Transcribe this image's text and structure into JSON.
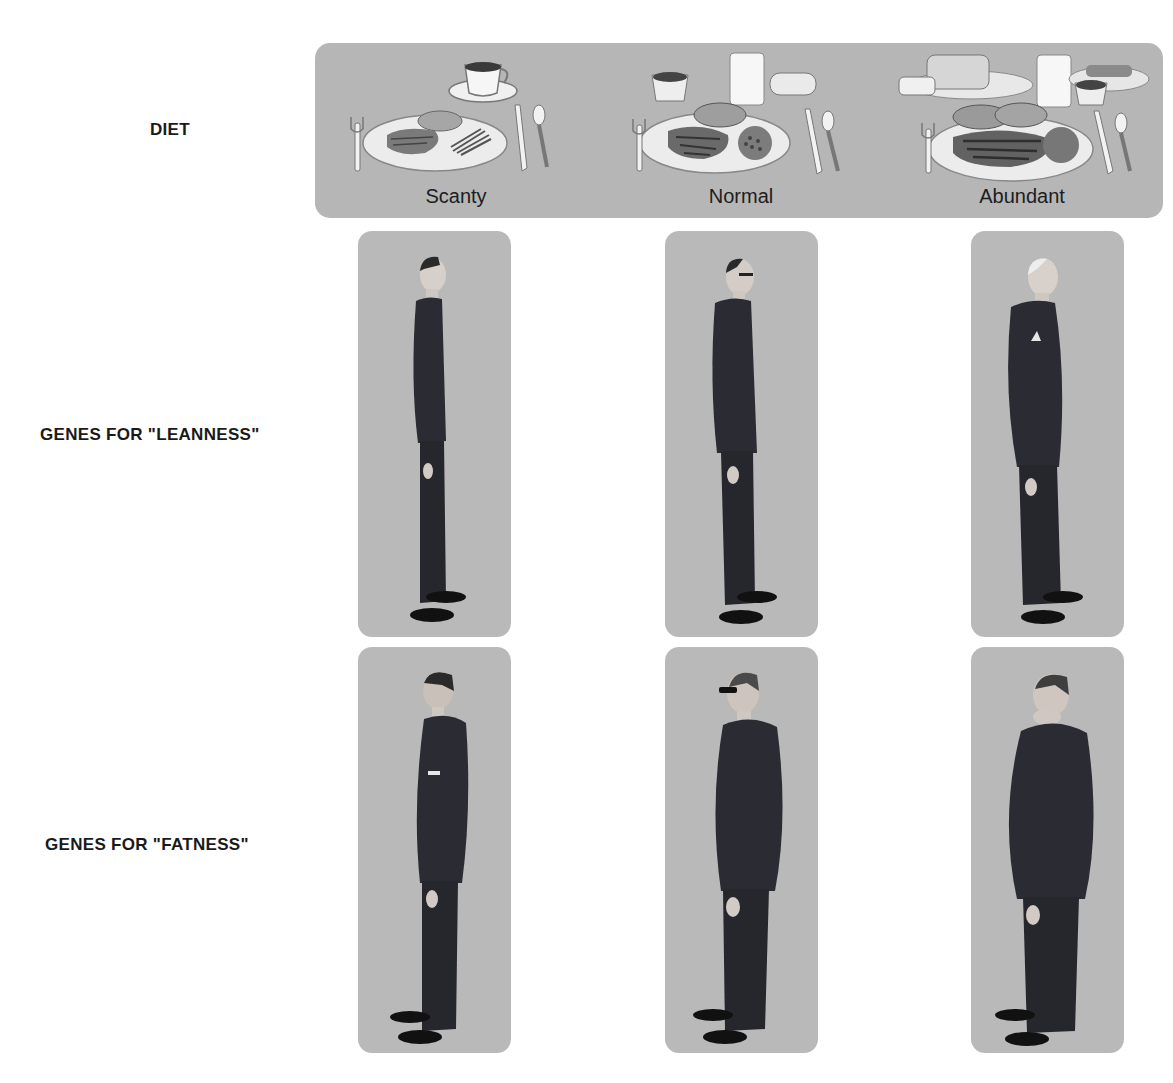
{
  "row_labels": {
    "diet": "DIET",
    "leanness": "GENES FOR \"LEANNESS\"",
    "fatness": "GENES FOR \"FATNESS\""
  },
  "diet_levels": [
    {
      "label": "Scanty",
      "items": [
        "coffee-cup",
        "plate-meat",
        "bread-roll",
        "green-beans",
        "fork",
        "knife",
        "spoon"
      ]
    },
    {
      "label": "Normal",
      "items": [
        "dessert-cup",
        "milk-glass",
        "bread-roll",
        "plate-steak",
        "potato",
        "peas",
        "fork",
        "knife",
        "spoon"
      ]
    },
    {
      "label": "Abundant",
      "items": [
        "bread-loaf",
        "butter-dish",
        "milk-glass",
        "side-dish",
        "dessert-cup",
        "plate-steak",
        "potatoes",
        "vegetables",
        "fork",
        "knife",
        "spoon"
      ]
    }
  ],
  "figures": {
    "leanness": [
      {
        "diet": "Scanty",
        "build": "very thin",
        "facing": "right",
        "hair": "dark"
      },
      {
        "diet": "Normal",
        "build": "thin",
        "facing": "right",
        "hair": "dark, glasses"
      },
      {
        "diet": "Abundant",
        "build": "slightly stout",
        "facing": "right",
        "hair": "white"
      }
    ],
    "fatness": [
      {
        "diet": "Scanty",
        "build": "average",
        "facing": "left",
        "hair": "dark"
      },
      {
        "diet": "Normal",
        "build": "stout",
        "facing": "left",
        "hair": "gray, glasses"
      },
      {
        "diet": "Abundant",
        "build": "obese",
        "facing": "left",
        "hair": "gray"
      }
    ]
  },
  "colors": {
    "panel": "#b6b6b6",
    "figure_panel": "#b9b9b9",
    "suit": "#2b2b33",
    "label_text": "#1a1a1a"
  }
}
